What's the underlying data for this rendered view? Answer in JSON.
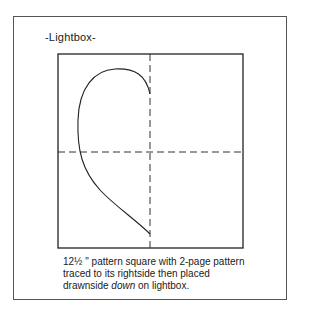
{
  "figure": {
    "title": "-Lightbox-",
    "caption": {
      "line1": "12½ \" pattern square with 2-page pattern",
      "line2": "traced to its rightside then placed",
      "line3_prefix": "drawnside ",
      "line3_emphasis": "down",
      "line3_suffix": " on lightbox."
    },
    "elements": {
      "pattern_square": "square outline",
      "vertical_fold_line": "dashed",
      "horizontal_fold_line": "dashed",
      "half_heart_curve": "traced pattern outline"
    }
  }
}
